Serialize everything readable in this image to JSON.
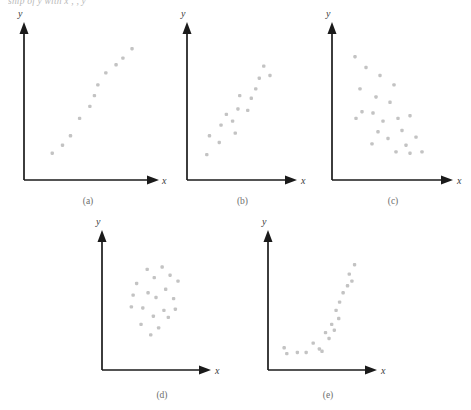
{
  "figure": {
    "top_cut_text": "ship of y with x  ,                                      ,                                      y",
    "background_color": "#ffffff",
    "dot_color": "#c3c3c3",
    "axis_color": "#1a1a1a",
    "label_color": "#6d6d6d"
  },
  "chart_data": [
    {
      "type": "scatter",
      "id": "a",
      "label": "(a)",
      "title": "",
      "xlabel": "x",
      "ylabel": "y",
      "xlim": [
        0,
        100
      ],
      "ylim": [
        0,
        100
      ],
      "grid": false,
      "legend": "none",
      "pattern": "strong positive linear",
      "points": [
        {
          "x": 16,
          "y": 14
        },
        {
          "x": 25,
          "y": 20
        },
        {
          "x": 32,
          "y": 27
        },
        {
          "x": 40,
          "y": 40
        },
        {
          "x": 49,
          "y": 49
        },
        {
          "x": 53,
          "y": 57
        },
        {
          "x": 56,
          "y": 65
        },
        {
          "x": 63,
          "y": 74
        },
        {
          "x": 72,
          "y": 80
        },
        {
          "x": 78,
          "y": 85
        },
        {
          "x": 86,
          "y": 92
        }
      ]
    },
    {
      "type": "scatter",
      "id": "b",
      "label": "(b)",
      "title": "",
      "xlabel": "x",
      "ylabel": "y",
      "xlim": [
        0,
        100
      ],
      "ylim": [
        0,
        100
      ],
      "grid": false,
      "legend": "none",
      "pattern": "moderate positive linear with scatter",
      "points": [
        {
          "x": 11,
          "y": 13
        },
        {
          "x": 14,
          "y": 27
        },
        {
          "x": 25,
          "y": 22
        },
        {
          "x": 27,
          "y": 35
        },
        {
          "x": 33,
          "y": 43
        },
        {
          "x": 40,
          "y": 38
        },
        {
          "x": 43,
          "y": 29
        },
        {
          "x": 46,
          "y": 47
        },
        {
          "x": 48,
          "y": 57
        },
        {
          "x": 57,
          "y": 46
        },
        {
          "x": 61,
          "y": 55
        },
        {
          "x": 66,
          "y": 62
        },
        {
          "x": 70,
          "y": 70
        },
        {
          "x": 75,
          "y": 79
        },
        {
          "x": 82,
          "y": 72
        }
      ]
    },
    {
      "type": "scatter",
      "id": "c",
      "label": "(c)",
      "title": "",
      "xlabel": "x",
      "ylabel": "y",
      "xlim": [
        0,
        100
      ],
      "ylim": [
        0,
        100
      ],
      "grid": false,
      "legend": "none",
      "pattern": "negative association with scatter",
      "points": [
        {
          "x": 13,
          "y": 86
        },
        {
          "x": 24,
          "y": 78
        },
        {
          "x": 18,
          "y": 62
        },
        {
          "x": 38,
          "y": 72
        },
        {
          "x": 34,
          "y": 56
        },
        {
          "x": 52,
          "y": 65
        },
        {
          "x": 20,
          "y": 45
        },
        {
          "x": 31,
          "y": 44
        },
        {
          "x": 48,
          "y": 52
        },
        {
          "x": 14,
          "y": 40
        },
        {
          "x": 56,
          "y": 40
        },
        {
          "x": 41,
          "y": 38
        },
        {
          "x": 68,
          "y": 42
        },
        {
          "x": 36,
          "y": 30
        },
        {
          "x": 60,
          "y": 31
        },
        {
          "x": 46,
          "y": 25
        },
        {
          "x": 30,
          "y": 21
        },
        {
          "x": 64,
          "y": 20
        },
        {
          "x": 74,
          "y": 26
        },
        {
          "x": 54,
          "y": 15
        },
        {
          "x": 68,
          "y": 14
        },
        {
          "x": 80,
          "y": 15
        }
      ]
    },
    {
      "type": "scatter",
      "id": "d",
      "label": "(d)",
      "title": "",
      "xlabel": "x",
      "ylabel": "y",
      "xlim": [
        0,
        100
      ],
      "ylim": [
        0,
        100
      ],
      "grid": false,
      "legend": "none",
      "pattern": "no association, random cloud",
      "points": [
        {
          "x": 40,
          "y": 80
        },
        {
          "x": 57,
          "y": 82
        },
        {
          "x": 48,
          "y": 73
        },
        {
          "x": 66,
          "y": 75
        },
        {
          "x": 28,
          "y": 68
        },
        {
          "x": 75,
          "y": 70
        },
        {
          "x": 61,
          "y": 63
        },
        {
          "x": 41,
          "y": 60
        },
        {
          "x": 24,
          "y": 58
        },
        {
          "x": 50,
          "y": 56
        },
        {
          "x": 70,
          "y": 55
        },
        {
          "x": 22,
          "y": 48
        },
        {
          "x": 35,
          "y": 47
        },
        {
          "x": 59,
          "y": 45
        },
        {
          "x": 72,
          "y": 46
        },
        {
          "x": 47,
          "y": 40
        },
        {
          "x": 64,
          "y": 39
        },
        {
          "x": 33,
          "y": 33
        },
        {
          "x": 53,
          "y": 30
        },
        {
          "x": 44,
          "y": 24
        }
      ]
    },
    {
      "type": "scatter",
      "id": "e",
      "label": "(e)",
      "title": "",
      "xlabel": "x",
      "ylabel": "y",
      "xlim": [
        0,
        100
      ],
      "ylim": [
        0,
        100
      ],
      "grid": false,
      "legend": "none",
      "pattern": "nonlinear curvilinear increasing",
      "points": [
        {
          "x": 7,
          "y": 13
        },
        {
          "x": 10,
          "y": 8
        },
        {
          "x": 22,
          "y": 9
        },
        {
          "x": 32,
          "y": 9
        },
        {
          "x": 40,
          "y": 17
        },
        {
          "x": 47,
          "y": 12
        },
        {
          "x": 50,
          "y": 10
        },
        {
          "x": 54,
          "y": 26
        },
        {
          "x": 58,
          "y": 21
        },
        {
          "x": 61,
          "y": 33
        },
        {
          "x": 64,
          "y": 28
        },
        {
          "x": 66,
          "y": 45
        },
        {
          "x": 69,
          "y": 38
        },
        {
          "x": 70,
          "y": 52
        },
        {
          "x": 74,
          "y": 60
        },
        {
          "x": 79,
          "y": 66
        },
        {
          "x": 81,
          "y": 76
        },
        {
          "x": 84,
          "y": 70
        },
        {
          "x": 87,
          "y": 84
        }
      ]
    }
  ]
}
